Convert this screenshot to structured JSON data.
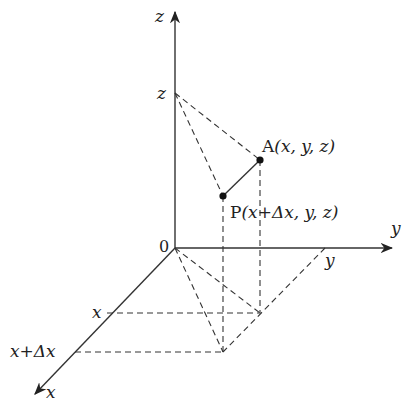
{
  "diagram": {
    "type": "3d-coordinate-axes",
    "axes": {
      "z_label": "z",
      "y_label": "y",
      "x_label": "x",
      "origin_label": "0"
    },
    "tick_labels": {
      "z": "z",
      "y": "y",
      "x": "x",
      "x_dx": "x+Δx"
    },
    "points": {
      "A": {
        "name": "A",
        "coords": "(x, y, z)"
      },
      "P": {
        "name": "P",
        "coords": "(x+Δx, y, z)"
      }
    },
    "colors": {
      "line": "#333333",
      "text": "#222222"
    }
  }
}
